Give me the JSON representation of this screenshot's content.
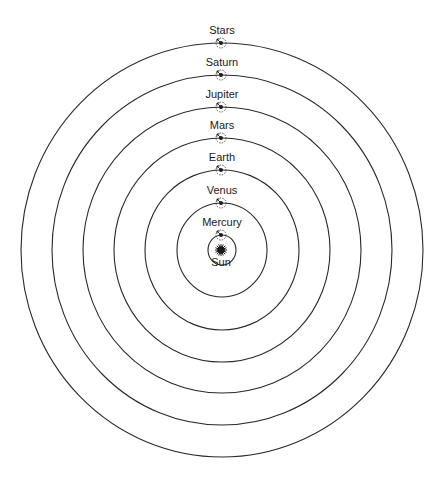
{
  "diagram": {
    "center": {
      "x": 222,
      "y": 250
    },
    "sun": {
      "label": "Sun"
    },
    "bodies": [
      {
        "label": "Mercury",
        "rx": 14,
        "ry": 15
      },
      {
        "label": "Venus",
        "rx": 45,
        "ry": 47
      },
      {
        "label": "Earth",
        "rx": 77,
        "ry": 80
      },
      {
        "label": "Mars",
        "rx": 108,
        "ry": 112
      },
      {
        "label": "Jupiter",
        "rx": 139,
        "ry": 143
      },
      {
        "label": "Saturn",
        "rx": 170,
        "ry": 175
      },
      {
        "label": "Stars",
        "rx": 201,
        "ry": 207
      }
    ],
    "colors": {
      "stroke": "#2a2a2a",
      "background": "#ffffff"
    }
  }
}
